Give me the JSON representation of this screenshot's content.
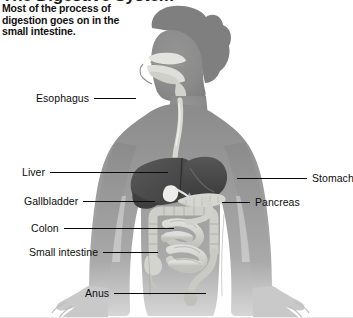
{
  "figure": {
    "title_cutoff": "The Digestive System",
    "caption": "Most of the process of digestion goes on in the small intestine.",
    "background_color": "#ffffff",
    "body_color": "#8b8b8b",
    "organ_dark_color": "#4a4a4a",
    "organ_light_color": "#d8d8d4",
    "leader_color": "#0b0b0b",
    "text_color": "#0d0d0d"
  },
  "labels": {
    "left": [
      {
        "name": "esophagus",
        "text": "Esophagus",
        "leader_px": 42
      },
      {
        "name": "liver",
        "text": "Liver",
        "leader_px": 118
      },
      {
        "name": "gallbladder",
        "text": "Gallbladder",
        "leader_px": 72
      },
      {
        "name": "colon",
        "text": "Colon",
        "leader_px": 110
      },
      {
        "name": "small-intestine",
        "text": "Small intestine",
        "leader_px": 55
      },
      {
        "name": "anus",
        "text": "Anus",
        "leader_px": 92
      }
    ],
    "right": [
      {
        "name": "stomach",
        "text": "Stomach",
        "leader_px": 70
      },
      {
        "name": "pancreas",
        "text": "Pancreas",
        "leader_px": 28
      }
    ]
  },
  "diagram": {
    "type": "anatomical-illustration",
    "view": "anterior torso with head in profile",
    "organs_depicted": [
      "mouth",
      "nasal cavity",
      "tongue",
      "esophagus",
      "liver",
      "gallbladder",
      "stomach",
      "pancreas",
      "small intestine",
      "colon",
      "rectum",
      "anus"
    ]
  }
}
